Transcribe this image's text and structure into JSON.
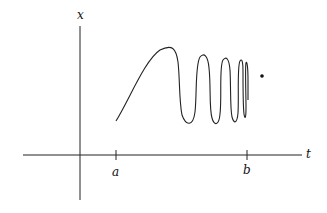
{
  "diagram": {
    "axes": {
      "vertical_label": "x",
      "horizontal_label": "t"
    },
    "ticks": [
      {
        "label": "a"
      },
      {
        "label": "b"
      }
    ],
    "elements": [
      "oscillating curve with increasing frequency from t=a toward t=b",
      "isolated point near t=b"
    ],
    "colors": {
      "stroke": "#222222",
      "background": "#ffffff"
    }
  }
}
